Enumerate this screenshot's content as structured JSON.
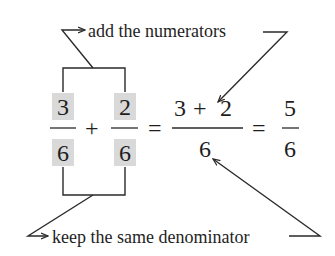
{
  "diagram": {
    "type": "annotated-fraction-addition",
    "top_annotation": "add the numerators",
    "bottom_annotation": "keep the same denominator",
    "colors": {
      "highlight": "#d9d9d9",
      "ink": "#1e1e1e",
      "background": "#ffffff"
    },
    "equation": {
      "fraction_1": {
        "numerator": "3",
        "denominator": "6",
        "highlighted": true
      },
      "operator_1": "+",
      "fraction_2": {
        "numerator": "2",
        "denominator": "6",
        "highlighted": true
      },
      "equals_1": "=",
      "fraction_3": {
        "numerator_left": "3",
        "numerator_op": "+",
        "numerator_right": "2",
        "denominator": "6"
      },
      "equals_2": "=",
      "fraction_4": {
        "numerator": "5",
        "denominator": "6"
      }
    },
    "arrows": [
      {
        "from": "numerator brackets",
        "to": "add the numerators label"
      },
      {
        "from": "add the numerators label",
        "to": "sum numerator 3 + 2"
      },
      {
        "from": "denominator brackets",
        "to": "keep the same denominator label"
      },
      {
        "from": "keep the same denominator label",
        "to": "result denominator 6"
      }
    ]
  }
}
